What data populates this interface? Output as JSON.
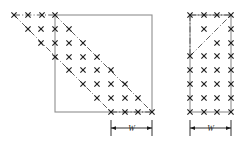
{
  "figure": {
    "background_color": "#ffffff",
    "colors": {
      "square_outline": "#8f8f8f",
      "dashdot_line": "#4a4a4a",
      "marker": "#1a1a1a",
      "dimension_line": "#1a1a1a",
      "text": "#1a1a1a"
    }
  },
  "panels": [
    {
      "id": "left-panel",
      "name": "left-figure",
      "shape": "square",
      "square": {
        "x": 55,
        "y": 15,
        "width": 97,
        "height": 97
      },
      "band_lines": [
        {
          "name": "upper-dashdot-diagonal",
          "x1": 55,
          "y1": 15,
          "x2": 152,
          "y2": 112
        },
        {
          "name": "lower-dashdot-diagonal",
          "x1": 14,
          "y1": 15,
          "x2": 111,
          "y2": 112
        },
        {
          "name": "top-dashdot-horizontal",
          "x1": 14,
          "y1": 15,
          "x2": 55,
          "y2": 15
        },
        {
          "name": "bottom-dashdot-horizontal",
          "x1": 111,
          "y1": 112,
          "x2": 152,
          "y2": 112
        }
      ],
      "marker_symbol": "x",
      "marker_count": 28,
      "markers": [
        {
          "x": 14,
          "y": 15
        },
        {
          "x": 28,
          "y": 15
        },
        {
          "x": 42,
          "y": 15
        },
        {
          "x": 55,
          "y": 15
        },
        {
          "x": 28,
          "y": 29
        },
        {
          "x": 41,
          "y": 29
        },
        {
          "x": 55,
          "y": 29
        },
        {
          "x": 69,
          "y": 29
        },
        {
          "x": 41,
          "y": 43
        },
        {
          "x": 55,
          "y": 43
        },
        {
          "x": 69,
          "y": 43
        },
        {
          "x": 83,
          "y": 43
        },
        {
          "x": 55,
          "y": 57
        },
        {
          "x": 69,
          "y": 57
        },
        {
          "x": 83,
          "y": 57
        },
        {
          "x": 97,
          "y": 57
        },
        {
          "x": 69,
          "y": 70
        },
        {
          "x": 83,
          "y": 70
        },
        {
          "x": 97,
          "y": 70
        },
        {
          "x": 111,
          "y": 70
        },
        {
          "x": 83,
          "y": 84
        },
        {
          "x": 97,
          "y": 84
        },
        {
          "x": 111,
          "y": 84
        },
        {
          "x": 125,
          "y": 84
        },
        {
          "x": 97,
          "y": 98
        },
        {
          "x": 111,
          "y": 98
        },
        {
          "x": 125,
          "y": 98
        },
        {
          "x": 138,
          "y": 98
        },
        {
          "x": 111,
          "y": 112
        },
        {
          "x": 125,
          "y": 112
        },
        {
          "x": 138,
          "y": 112
        },
        {
          "x": 152,
          "y": 112
        }
      ],
      "dimension": {
        "name": "width-dimension-left",
        "label": "W",
        "x1": 111,
        "x2": 152,
        "y": 128,
        "tick_top": 120,
        "tick_bottom": 136
      }
    },
    {
      "id": "right-panel",
      "name": "right-figure",
      "shape": "rectangle",
      "rectangle": {
        "x": 190,
        "y": 15,
        "width": 41,
        "height": 97
      },
      "band_lines": [
        {
          "name": "dashdot-diagonal",
          "x1": 190,
          "y1": 56,
          "x2": 231,
          "y2": 15
        },
        {
          "name": "left-dashdot-vertical",
          "x1": 190,
          "y1": 15,
          "x2": 190,
          "y2": 56
        },
        {
          "name": "top-dashdot-horizontal",
          "x1": 190,
          "y1": 15,
          "x2": 231,
          "y2": 15
        }
      ],
      "marker_symbol": "x",
      "marker_count": 24,
      "markers": [
        {
          "x": 190,
          "y": 15
        },
        {
          "x": 204,
          "y": 15
        },
        {
          "x": 217,
          "y": 15
        },
        {
          "x": 231,
          "y": 15
        },
        {
          "x": 204,
          "y": 29
        },
        {
          "x": 231,
          "y": 29
        },
        {
          "x": 217,
          "y": 43
        },
        {
          "x": 231,
          "y": 43
        },
        {
          "x": 190,
          "y": 56
        },
        {
          "x": 204,
          "y": 56
        },
        {
          "x": 217,
          "y": 56
        },
        {
          "x": 231,
          "y": 56
        },
        {
          "x": 190,
          "y": 70
        },
        {
          "x": 204,
          "y": 70
        },
        {
          "x": 217,
          "y": 70
        },
        {
          "x": 231,
          "y": 70
        },
        {
          "x": 190,
          "y": 84
        },
        {
          "x": 204,
          "y": 84
        },
        {
          "x": 217,
          "y": 84
        },
        {
          "x": 231,
          "y": 84
        },
        {
          "x": 190,
          "y": 98
        },
        {
          "x": 204,
          "y": 98
        },
        {
          "x": 217,
          "y": 98
        },
        {
          "x": 231,
          "y": 98
        },
        {
          "x": 190,
          "y": 112
        },
        {
          "x": 204,
          "y": 112
        },
        {
          "x": 217,
          "y": 112
        },
        {
          "x": 231,
          "y": 112
        }
      ],
      "dimension": {
        "name": "width-dimension-right",
        "label": "W",
        "x1": 190,
        "x2": 231,
        "y": 128,
        "tick_top": 120,
        "tick_bottom": 136
      }
    }
  ]
}
